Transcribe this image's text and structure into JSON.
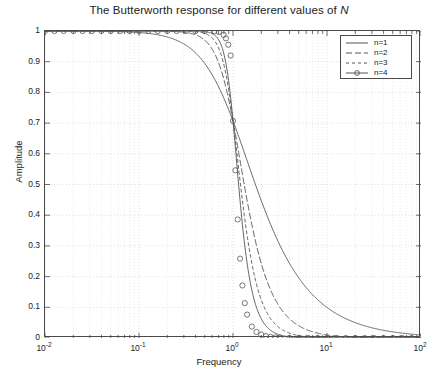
{
  "chart_data": {
    "type": "line",
    "title": "The Butterworth response for different values of N",
    "title_plain": "The Butterworth response for different values of",
    "title_italic": "N",
    "xlabel": "Frequency",
    "ylabel": "Amplitude",
    "xscale": "log",
    "yscale": "linear",
    "xlim": [
      0.01,
      100
    ],
    "ylim": [
      0,
      1
    ],
    "grid": true,
    "grid_style": "dotted",
    "legend_position": "upper right",
    "xticks": [
      0.01,
      0.1,
      1,
      10,
      100
    ],
    "xtick_labels": [
      "10-2",
      "10-1",
      "100",
      "101",
      "102"
    ],
    "xtick_bases": [
      "10",
      "10",
      "10",
      "10",
      "10"
    ],
    "xtick_exponents": [
      "-2",
      "-1",
      "0",
      "1",
      "2"
    ],
    "yticks": [
      0,
      0.1,
      0.2,
      0.3,
      0.4,
      0.5,
      0.6,
      0.7,
      0.8,
      0.9,
      1
    ],
    "ytick_labels": [
      "0",
      "0.1",
      "0.2",
      "0.3",
      "0.4",
      "0.5",
      "0.6",
      "0.7",
      "0.8",
      "0.9",
      "1"
    ],
    "colors": {
      "line": "#555555",
      "axis": "#4a4a4a",
      "grid": "#c8c8c8",
      "text": "#222222",
      "background": "#ffffff"
    },
    "annotations": {
      "cutoff_frequency": 1,
      "cutoff_amplitude": 0.707
    },
    "series": [
      {
        "name": "n=1",
        "order": 1,
        "style": "solid",
        "marker": "none",
        "x": [
          0.01,
          0.0158,
          0.0251,
          0.0398,
          0.0631,
          0.1,
          0.1585,
          0.2512,
          0.3162,
          0.3981,
          0.5012,
          0.631,
          0.7943,
          0.8913,
          1.0,
          1.122,
          1.259,
          1.585,
          1.995,
          2.512,
          3.162,
          3.981,
          5.012,
          6.31,
          7.943,
          10.0,
          12.59,
          15.85,
          19.95,
          25.12,
          31.62,
          39.81,
          50.12,
          63.1,
          79.43,
          100.0
        ],
        "y": [
          1.0,
          1.0,
          1.0,
          0.999,
          0.998,
          0.995,
          0.988,
          0.9698,
          0.9535,
          0.9292,
          0.8942,
          0.8457,
          0.7832,
          0.7467,
          0.7071,
          0.6657,
          0.6222,
          0.5334,
          0.4481,
          0.3697,
          0.3017,
          0.2437,
          0.1955,
          0.1563,
          0.1249,
          0.0995,
          0.0793,
          0.0629,
          0.0501,
          0.0398,
          0.0316,
          0.0251,
          0.02,
          0.0158,
          0.0126,
          0.01
        ]
      },
      {
        "name": "n=2",
        "order": 2,
        "style": "dashed",
        "marker": "none",
        "x": [
          0.01,
          0.0251,
          0.0631,
          0.1,
          0.1585,
          0.2512,
          0.3162,
          0.3981,
          0.5012,
          0.631,
          0.7079,
          0.7943,
          0.8913,
          1.0,
          1.122,
          1.259,
          1.412,
          1.585,
          1.778,
          1.995,
          2.239,
          2.512,
          3.162,
          3.981,
          5.012,
          6.31,
          7.943,
          10.0,
          12.59,
          15.85,
          19.95,
          31.62,
          50.12,
          100.0
        ],
        "y": [
          1.0,
          1.0,
          1.0,
          1.0,
          0.9997,
          0.9968,
          0.9951,
          0.9876,
          0.9695,
          0.9296,
          0.8944,
          0.8484,
          0.7847,
          0.7071,
          0.6233,
          0.5345,
          0.4473,
          0.3676,
          0.2986,
          0.2409,
          0.1932,
          0.1553,
          0.0996,
          0.063,
          0.0398,
          0.0251,
          0.0158,
          0.01,
          0.0063,
          0.004,
          0.0025,
          0.001,
          0.0004,
          0.0001
        ]
      },
      {
        "name": "n=3",
        "order": 3,
        "style": "dashdot",
        "marker": "none",
        "x": [
          0.01,
          0.0631,
          0.1585,
          0.2512,
          0.3981,
          0.5012,
          0.631,
          0.7079,
          0.7943,
          0.8414,
          0.8913,
          0.9441,
          1.0,
          1.059,
          1.122,
          1.189,
          1.259,
          1.334,
          1.412,
          1.585,
          1.778,
          1.995,
          2.239,
          2.512,
          3.162,
          3.981,
          5.012,
          6.31,
          7.943,
          10.0,
          15.85,
          31.62,
          100.0
        ],
        "y": [
          1.0,
          1.0,
          1.0,
          1.0,
          0.9998,
          0.9984,
          0.9922,
          0.9831,
          0.9656,
          0.9498,
          0.9272,
          0.8959,
          0.7071,
          0.6059,
          0.4976,
          0.3975,
          0.3121,
          0.2428,
          0.1881,
          0.1242,
          0.0881,
          0.0627,
          0.0446,
          0.0316,
          0.0158,
          0.0079,
          0.004,
          0.002,
          0.001,
          0.0005,
          0.00016,
          3e-05,
          1e-06
        ]
      },
      {
        "name": "n=4",
        "order": 4,
        "style": "solid",
        "marker": "circle",
        "x": [
          0.01,
          0.0126,
          0.0158,
          0.02,
          0.0251,
          0.0316,
          0.0398,
          0.0501,
          0.0631,
          0.0794,
          0.1,
          0.1259,
          0.1585,
          0.1995,
          0.2512,
          0.3162,
          0.3981,
          0.5012,
          0.631,
          0.7079,
          0.7943,
          0.8414,
          0.8913,
          0.9441,
          1.0,
          1.059,
          1.122,
          1.189,
          1.259,
          1.334,
          1.413,
          1.585,
          1.778,
          1.995,
          2.239,
          2.512,
          2.818,
          3.162,
          3.981,
          5.012,
          6.31,
          7.943,
          10.0,
          12.59,
          15.85,
          19.95,
          25.12,
          31.62,
          39.81,
          50.12,
          63.1,
          79.43,
          100.0
        ],
        "y": [
          1.0,
          1.0,
          1.0,
          1.0,
          1.0,
          1.0,
          1.0,
          1.0,
          1.0,
          1.0,
          1.0,
          1.0,
          1.0,
          1.0,
          1.0,
          1.0,
          1.0,
          0.9999,
          0.9992,
          0.9968,
          0.9874,
          0.9758,
          0.9552,
          0.9203,
          0.7071,
          0.5462,
          0.3861,
          0.2585,
          0.1711,
          0.1136,
          0.0762,
          0.0373,
          0.0198,
          0.0112,
          0.0063,
          0.0036,
          0.0021,
          0.0012,
          0.0004,
          0.00016,
          6e-05,
          2.5e-05,
          1e-05,
          4e-06,
          1.6e-06,
          6e-07,
          3e-07,
          1e-07,
          4e-08,
          2e-08,
          6e-09,
          3e-09,
          1e-09
        ]
      }
    ]
  },
  "legend": {
    "items": [
      {
        "label": "n=1",
        "style": "solid",
        "marker": "none"
      },
      {
        "label": "n=2",
        "style": "dashed",
        "marker": "none"
      },
      {
        "label": "n=3",
        "style": "dashdot",
        "marker": "none"
      },
      {
        "label": "n=4",
        "style": "solid",
        "marker": "circle"
      }
    ]
  }
}
